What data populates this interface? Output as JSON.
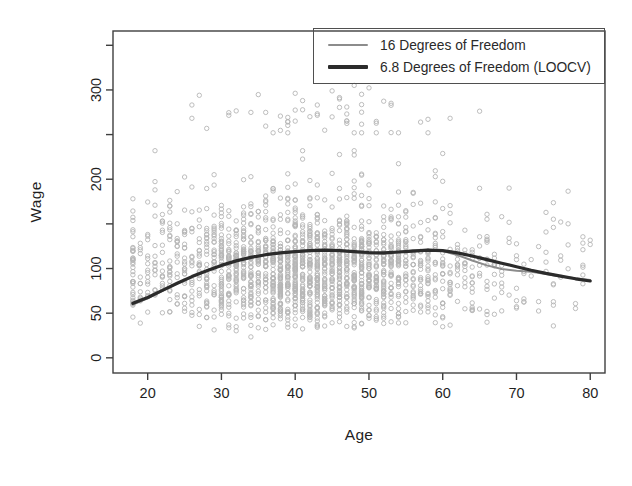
{
  "figure": {
    "background": "#ffffff",
    "frame_color": "#3f3f3f",
    "tick_text_color": "#1f1f1f"
  },
  "chart_data": {
    "type": "scatter",
    "title": "",
    "xlabel": "Age",
    "ylabel": "Wage",
    "xlim": [
      15.3,
      82.0
    ],
    "ylim": [
      -17,
      366
    ],
    "grid": false,
    "x_ticks": [
      {
        "v": 20,
        "label": "20"
      },
      {
        "v": 30,
        "label": "30"
      },
      {
        "v": 40,
        "label": "40"
      },
      {
        "v": 50,
        "label": "50"
      },
      {
        "v": 60,
        "label": "60"
      },
      {
        "v": 70,
        "label": "70"
      },
      {
        "v": 80,
        "label": "80"
      }
    ],
    "y_ticks": [
      {
        "v": 0,
        "label": "0"
      },
      {
        "v": 50,
        "label": "50"
      },
      {
        "v": 100,
        "label": "100"
      },
      {
        "v": 150,
        "label": ""
      },
      {
        "v": 200,
        "label": "200"
      },
      {
        "v": 250,
        "label": ""
      },
      {
        "v": 300,
        "label": "300"
      },
      {
        "v": 350,
        "label": ""
      }
    ],
    "legend": {
      "position": "topright",
      "border": true,
      "entries": [
        {
          "label": "16 Degrees of Freedom",
          "color": "#8c8c8c",
          "line_width": 2
        },
        {
          "label": "6.8 Degrees of Freedom (LOOCV)",
          "color": "#2b2b2b",
          "line_width": 3.2
        }
      ]
    },
    "series": [
      {
        "name": "16 Degrees of Freedom",
        "type": "line",
        "color": "#8c8c8c",
        "stroke_width": 2,
        "points": [
          [
            18,
            59.5
          ],
          [
            20,
            66.5
          ],
          [
            22,
            75
          ],
          [
            24,
            83
          ],
          [
            26,
            90.5
          ],
          [
            28,
            97.5
          ],
          [
            30,
            103.5
          ],
          [
            32,
            108.5
          ],
          [
            34,
            112.5
          ],
          [
            36,
            115.5
          ],
          [
            38,
            117.5
          ],
          [
            40,
            119
          ],
          [
            42,
            120.5
          ],
          [
            44,
            121
          ],
          [
            46,
            120.5
          ],
          [
            48,
            118.5
          ],
          [
            50,
            116.5
          ],
          [
            52,
            116.5
          ],
          [
            54,
            118.5
          ],
          [
            56,
            120.5
          ],
          [
            58,
            121
          ],
          [
            60,
            119.5
          ],
          [
            62,
            115
          ],
          [
            64,
            109
          ],
          [
            66,
            103.5
          ],
          [
            68,
            99.5
          ],
          [
            70,
            97.5
          ],
          [
            72,
            96.5
          ],
          [
            74,
            94
          ],
          [
            76,
            91
          ],
          [
            78,
            89
          ],
          [
            80,
            87
          ]
        ]
      },
      {
        "name": "6.8 Degrees of Freedom (LOOCV)",
        "type": "line",
        "color": "#2b2b2b",
        "stroke_width": 3.2,
        "points": [
          [
            18,
            61
          ],
          [
            20,
            67.5
          ],
          [
            22,
            75.5
          ],
          [
            24,
            83.5
          ],
          [
            26,
            91
          ],
          [
            28,
            97.5
          ],
          [
            30,
            103.5
          ],
          [
            32,
            108.5
          ],
          [
            34,
            112.5
          ],
          [
            36,
            115.5
          ],
          [
            38,
            117.5
          ],
          [
            40,
            119
          ],
          [
            42,
            120
          ],
          [
            44,
            120.5
          ],
          [
            46,
            120
          ],
          [
            48,
            119
          ],
          [
            50,
            118
          ],
          [
            52,
            117.5
          ],
          [
            54,
            118.5
          ],
          [
            56,
            119.5
          ],
          [
            58,
            120.5
          ],
          [
            60,
            120
          ],
          [
            62,
            117.5
          ],
          [
            64,
            114
          ],
          [
            66,
            110
          ],
          [
            68,
            106
          ],
          [
            70,
            102
          ],
          [
            72,
            98
          ],
          [
            74,
            94.5
          ],
          [
            76,
            91.5
          ],
          [
            78,
            88.5
          ],
          [
            80,
            86
          ]
        ]
      }
    ],
    "scatter": {
      "name": "wage-observations",
      "marker": "open-circle",
      "color": "#b5b5b5",
      "radius": 2.2,
      "stroke_width": 0.9,
      "seed": 42,
      "age_min": 18,
      "age_max": 80,
      "n_main": 1940,
      "main_age_mean": 42,
      "main_age_sd": 11.5,
      "main_age_uniform_frac": 0.1,
      "main_wage_logmedian": 4.63,
      "main_wage_logsd_low": 0.45,
      "main_wage_logsd_high": 0.28,
      "main_wage_min": 20,
      "main_wage_max": 232,
      "n_high": 60,
      "high_age_mean": 45,
      "high_age_sd": 9,
      "high_age_min": 26,
      "high_age_max": 66,
      "high_wage_mean": 272,
      "high_wage_sd": 16,
      "high_wage_min": 252,
      "high_wage_max": 318
    }
  }
}
